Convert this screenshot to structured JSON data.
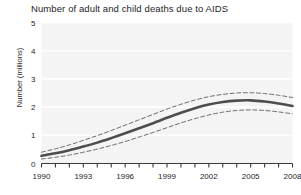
{
  "chart_data": {
    "type": "line",
    "title": "Number of adult and child deaths due to AIDS",
    "xlabel": "",
    "ylabel": "Number (millions)",
    "xlim": [
      1990,
      2008
    ],
    "ylim": [
      0,
      5
    ],
    "y_ticks": [
      "0",
      "1",
      "2",
      "3",
      "4",
      "5"
    ],
    "y_tick_values": [
      0,
      1,
      2,
      3,
      4,
      5
    ],
    "x_ticks": [
      "1990",
      "1993",
      "1996",
      "1999",
      "2002",
      "2005",
      "2008"
    ],
    "x_tick_values": [
      1990,
      1993,
      1996,
      1999,
      2002,
      2005,
      2008
    ],
    "x_minor_ticks": [
      1990,
      1991,
      1992,
      1993,
      1994,
      1995,
      1996,
      1997,
      1998,
      1999,
      2000,
      2001,
      2002,
      2003,
      2004,
      2005,
      2006,
      2007,
      2008
    ],
    "grid": true,
    "grid_color": "#ffffff",
    "plot_background": "#f4f4f4",
    "legend_position": "none",
    "x": [
      1990,
      1991,
      1992,
      1993,
      1994,
      1995,
      1996,
      1997,
      1998,
      1999,
      2000,
      2001,
      2002,
      2003,
      2004,
      2005,
      2006,
      2007,
      2008
    ],
    "series": [
      {
        "name": "Estimate",
        "style": "solid",
        "color": "#4d4d4d",
        "width": 2.6,
        "values": [
          0.27,
          0.36,
          0.47,
          0.6,
          0.74,
          0.9,
          1.07,
          1.25,
          1.43,
          1.62,
          1.8,
          1.96,
          2.09,
          2.18,
          2.23,
          2.24,
          2.2,
          2.13,
          2.04
        ]
      },
      {
        "name": "Upper bound",
        "style": "dashed",
        "color": "#6b6b6b",
        "width": 1.0,
        "values": [
          0.4,
          0.52,
          0.66,
          0.82,
          0.99,
          1.17,
          1.36,
          1.55,
          1.74,
          1.93,
          2.1,
          2.25,
          2.37,
          2.45,
          2.5,
          2.51,
          2.48,
          2.42,
          2.34
        ]
      },
      {
        "name": "Lower bound",
        "style": "dashed",
        "color": "#6b6b6b",
        "width": 1.0,
        "values": [
          0.16,
          0.22,
          0.3,
          0.4,
          0.51,
          0.64,
          0.78,
          0.94,
          1.1,
          1.27,
          1.44,
          1.59,
          1.72,
          1.82,
          1.88,
          1.9,
          1.88,
          1.83,
          1.76
        ]
      }
    ]
  }
}
